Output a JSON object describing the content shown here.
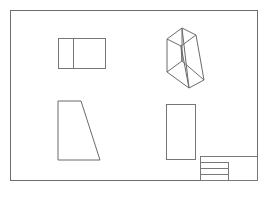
{
  "sheet": {
    "width": 273,
    "height": 197,
    "background_color": "#ffffff",
    "line_color": "#767676",
    "border_color": "#6e6e6e",
    "title": "Engineering Drawing Sheet",
    "border": {
      "x": 10,
      "y": 10,
      "width": 248,
      "height": 171
    }
  },
  "views": [
    {
      "name": "front-view-split-rectangle",
      "label": "Front View",
      "shape": "rectangle-with-vertical-divider",
      "x": 58,
      "y": 38,
      "width": 48,
      "height": 31,
      "divider_x": 73
    },
    {
      "name": "isometric-wedge-prism",
      "label": "Isometric View",
      "shape": "wedge-prism-wireframe",
      "x": 163,
      "y": 27,
      "width": 42,
      "height": 60,
      "vertices": {
        "top_back_left": [
          167,
          39
        ],
        "top_back_right": [
          182,
          28
        ],
        "top_front_right": [
          196,
          35
        ],
        "top_front_left": [
          181,
          46
        ],
        "bottom_back_left": [
          167,
          72
        ],
        "bottom_back_right": [
          182,
          61
        ],
        "bottom_front_right": [
          204,
          80
        ],
        "bottom_front_left": [
          189,
          88
        ]
      }
    },
    {
      "name": "side-view-trapezoid",
      "label": "Side View",
      "shape": "right-trapezoid",
      "x": 58,
      "y": 101,
      "width": 42,
      "height": 59,
      "points": "58,101 81,101 100,160 58,160"
    },
    {
      "name": "top-view-rectangle",
      "label": "Top View",
      "shape": "rectangle",
      "x": 166,
      "y": 104,
      "width": 30,
      "height": 56
    }
  ],
  "title_block": {
    "name": "title-block",
    "label": "Title Block",
    "x": 200,
    "y": 156,
    "width": 58,
    "height": 25,
    "column_divider_x": 228,
    "rows": [
      {
        "name": "title-block-row-1",
        "y": 156,
        "height": 6,
        "full_width": true,
        "text": ""
      },
      {
        "name": "title-block-row-2",
        "y": 162,
        "height": 6,
        "full_width": false,
        "text": ""
      },
      {
        "name": "title-block-row-3",
        "y": 168,
        "height": 6,
        "full_width": false,
        "text": ""
      },
      {
        "name": "title-block-row-4",
        "y": 174,
        "height": 7,
        "full_width": false,
        "text": ""
      }
    ]
  }
}
